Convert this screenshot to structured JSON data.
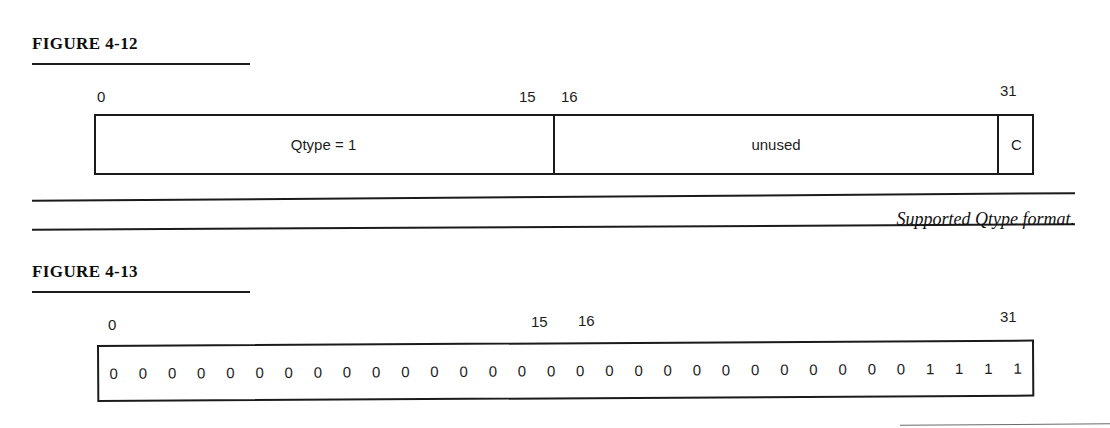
{
  "page": {
    "background": "#ffffff",
    "ink_color": "#1b1b1b"
  },
  "figure_412": {
    "heading": "FIGURE 4-12",
    "caption": "Supported Qtype format.",
    "bit_labels": {
      "start": "0",
      "mid_left": "15",
      "mid_right": "16",
      "end": "31"
    },
    "fields": [
      {
        "label": "Qtype = 1",
        "bits": "0-15"
      },
      {
        "label": "unused",
        "bits": "16-30"
      },
      {
        "label": "C",
        "bits": "31"
      }
    ]
  },
  "figure_413": {
    "heading": "FIGURE 4-13",
    "bit_labels": {
      "start": "0",
      "mid_left": "15",
      "mid_right": "16",
      "end": "31"
    },
    "bits": [
      "0",
      "0",
      "0",
      "0",
      "0",
      "0",
      "0",
      "0",
      "0",
      "0",
      "0",
      "0",
      "0",
      "0",
      "0",
      "0",
      "0",
      "0",
      "0",
      "0",
      "0",
      "0",
      "0",
      "0",
      "0",
      "0",
      "0",
      "0",
      "1",
      "1",
      "1",
      "1"
    ]
  }
}
